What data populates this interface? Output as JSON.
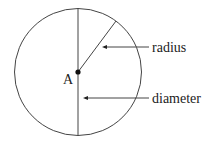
{
  "diagram": {
    "center_label": "A",
    "labels": {
      "radius": "radius",
      "diameter": "diameter"
    },
    "colors": {
      "stroke": "#333333",
      "text": "#222222",
      "background": "#ffffff"
    }
  }
}
